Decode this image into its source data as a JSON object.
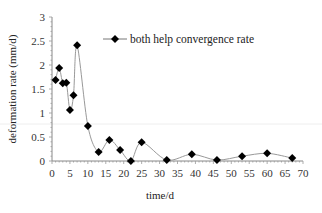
{
  "chart_data": {
    "type": "line",
    "title": "",
    "xlabel": "time/d",
    "ylabel": "deformation rate (mm/d)",
    "xlim": [
      0,
      70
    ],
    "ylim": [
      0,
      3
    ],
    "x_ticks": [
      0,
      5,
      10,
      15,
      20,
      25,
      30,
      35,
      40,
      45,
      50,
      55,
      60,
      65,
      70
    ],
    "y_ticks": [
      0,
      0.5,
      1,
      1.5,
      2,
      2.5,
      3
    ],
    "y_tick_labels": [
      "0",
      "0.5",
      "1",
      "1.5",
      "2",
      "2.5",
      "3"
    ],
    "grid": false,
    "legend_position": "upper right",
    "series": [
      {
        "name": "both help convergence rate",
        "color": "#000000",
        "line_color": "#999999",
        "marker": "diamond",
        "smooth": true,
        "x": [
          1,
          2,
          3,
          4,
          5,
          6,
          7,
          10,
          13,
          16,
          19,
          22,
          25,
          32,
          39,
          46,
          53,
          60,
          67
        ],
        "values": [
          1.69,
          1.94,
          1.62,
          1.63,
          1.06,
          1.37,
          2.41,
          0.73,
          0.19,
          0.44,
          0.23,
          0.0,
          0.39,
          0.02,
          0.14,
          0.02,
          0.1,
          0.16,
          0.06
        ]
      }
    ]
  }
}
